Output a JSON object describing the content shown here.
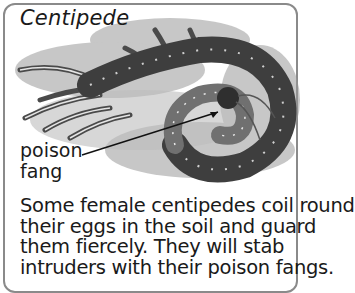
{
  "card": {
    "title": "Centipede",
    "labels": [
      "poison",
      "fang"
    ],
    "caption_lines": [
      "Some female centipedes coil round",
      "their eggs in the soil and guard",
      "them fiercely. They will stab",
      "intruders with their poison fangs."
    ],
    "illustration": "coiled-centipede-drawing",
    "colors": {
      "border": "#8a8a8a",
      "text": "#1a1a1a",
      "ink": "#3a3a3a"
    }
  }
}
